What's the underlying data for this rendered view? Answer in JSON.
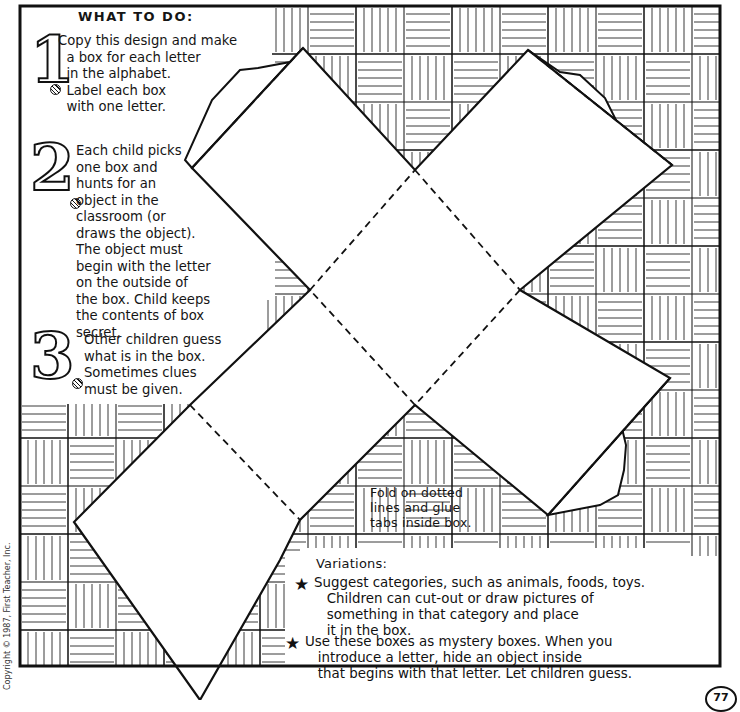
{
  "worksheet": {
    "heading": "WHAT TO DO:",
    "steps": [
      {
        "number": "1",
        "text": "Copy this design and make\n  a box for each letter\n  in the alphabet.\n  Label each box\n  with one letter."
      },
      {
        "number": "2",
        "text": "Each child picks\none box and\nhunts for an\nobject in the\nclassroom (or\ndraws the object).\nThe object must\nbegin with the letter\non the outside of\nthe box. Child keeps\nthe contents of box\nsecret."
      },
      {
        "number": "3",
        "text": "Other children guess\nwhat is in the box.\nSometimes clues\nmust be given."
      }
    ],
    "fold_note": "Fold on dotted\nlines and glue\ntabs inside box.",
    "variations": {
      "title": "Variations:",
      "items": [
        {
          "icon": "star-icon",
          "text": "Suggest categories, such as animals, foods, toys.\n   Children can cut-out or draw pictures of\n   something in that category and place\n   it in the box."
        },
        {
          "icon": "star-icon",
          "text": "Use these boxes as mystery boxes. When you\n   introduce a letter, hide an object inside\n   that begins with that letter. Let children guess."
        }
      ]
    },
    "copyright": "Copyright © 1987, First Teacher, Inc.",
    "page_number": "77"
  },
  "colors": {
    "ink": "#111111",
    "paper": "#ffffff"
  }
}
